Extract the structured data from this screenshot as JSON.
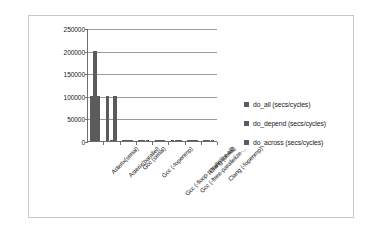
{
  "chart_data": {
    "type": "bar",
    "title": "",
    "xlabel": "",
    "ylabel": "",
    "ylim": [
      0,
      250000
    ],
    "ytick_labels": [
      "250000",
      "200000",
      "150000",
      "100000",
      "50000",
      "0"
    ],
    "ytick_values": [
      250000,
      200000,
      150000,
      100000,
      50000,
      0
    ],
    "grid": true,
    "legend_position": "right",
    "categories": [
      "Asterix(serial)",
      "Asterix(parallel)",
      "Gcc (serial)",
      "Gcc (-fopenmp)",
      "Gcc (-floop-parallelize-all)",
      "Gcc (-ftree-parallelize-...",
      "Clang (serial)",
      "Clang (-fopenmp)"
    ],
    "series": [
      {
        "name": "do_all (secs/cycles)",
        "color": "#5b5b5b",
        "values": [
          100000,
          100000,
          1200,
          1200,
          1200,
          1200,
          1200,
          1200
        ]
      },
      {
        "name": "do_depend (secs/cycles)",
        "color": "#5b5b5b",
        "values": [
          200000,
          1500,
          1200,
          1200,
          1200,
          1200,
          1200,
          1200
        ]
      },
      {
        "name": "do_across (secs/cycles)",
        "color": "#5b5b5b",
        "values": [
          100000,
          100000,
          1200,
          1200,
          1200,
          1200,
          1200,
          1200
        ]
      }
    ]
  },
  "legend": {
    "items": [
      {
        "label": "do_all (secs/cycles)",
        "color": "#5b5b5b"
      },
      {
        "label": "do_depend (secs/cycles)",
        "color": "#5b5b5b"
      },
      {
        "label": "do_across (secs/cycles)",
        "color": "#5b5b5b"
      }
    ]
  },
  "colors": {
    "series": "#5b5b5b",
    "gridline": "#9a9a9a",
    "axis": "#6e6e6e",
    "frame_border": "#c8c8c8",
    "background": "#ffffff",
    "text": "#1a1a1a"
  }
}
